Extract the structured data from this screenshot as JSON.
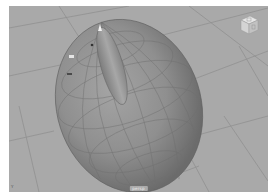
{
  "viewport": {
    "background_color": "#a9a9a9",
    "grid_color": "#8f8f8f",
    "camera_label": "persp",
    "axis_label": "Y",
    "viewcube": {
      "top_face_label": "TOP",
      "front_face_label": "FRONT",
      "icon": "view-cube-icon"
    },
    "objects": [
      {
        "name": "egg-body",
        "type": "nurbs-ellipsoid",
        "color": "#8e8e8e"
      },
      {
        "name": "ridge-bump",
        "type": "elongated-ellipsoid",
        "color": "#9a9a9a"
      }
    ]
  }
}
